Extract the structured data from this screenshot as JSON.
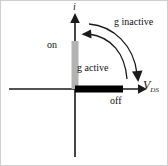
{
  "figure": {
    "axes": {
      "y_label": "i",
      "x_label_main": "V",
      "x_label_sub": "DS"
    },
    "labels": {
      "on": "on",
      "off": "off",
      "g_active": "g active",
      "g_inactive": "g inactive"
    },
    "colors": {
      "axis": "#1a1a1a",
      "on_bar": "#b3b3b3",
      "off_bar": "#000000",
      "arrow": "#1a1a1a",
      "background": "#ffffff",
      "border": "#cfcfcf"
    },
    "geometry": {
      "origin_x": 74,
      "origin_y": 88,
      "on_bar_top": 40,
      "off_bar_right": 122,
      "x_axis_arrow_x": 143,
      "y_axis_arrow_y": 14,
      "y_axis_bottom": 156,
      "x_axis_left": 8
    }
  }
}
